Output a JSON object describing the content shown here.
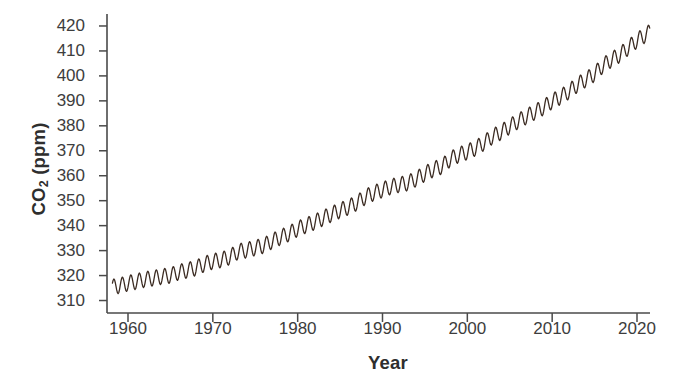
{
  "chart_data": {
    "type": "line",
    "title": "",
    "xlabel": "Year",
    "ylabel": "CO2 (ppm)",
    "ylabel_parts": {
      "pre": "CO",
      "sub": "2",
      "post": " (ppm)"
    },
    "xlim": [
      1957.5,
      1965.0
    ],
    "ylim": [
      305.0,
      424.0
    ],
    "xticks": [
      1960,
      1970,
      1980,
      1990,
      2000,
      2010,
      2020
    ],
    "xtick_labels": [
      "1960",
      "1970",
      "1980",
      "1990",
      "2000",
      "2010",
      "2020"
    ],
    "yticks": [
      310,
      320,
      330,
      340,
      350,
      360,
      370,
      380,
      390,
      400,
      410,
      420
    ],
    "ytick_labels": [
      "310",
      "320",
      "330",
      "340",
      "350",
      "360",
      "370",
      "380",
      "390",
      "400",
      "410",
      "420"
    ],
    "grid": false,
    "legend": null,
    "line_color": "#3b2b22",
    "line_width": 1.3,
    "seasonal_amplitude_ppm": 3.1,
    "series": [
      {
        "name": "Monthly mean CO2 (Mauna Loa)",
        "note": "Annual mean trend; monthly values oscillate about it with a seasonal sawtooth of roughly 3 ppm amplitude peaking in May.",
        "x": [
          1958,
          1959,
          1960,
          1961,
          1962,
          1963,
          1964,
          1965,
          1966,
          1967,
          1968,
          1969,
          1970,
          1971,
          1972,
          1973,
          1974,
          1975,
          1976,
          1977,
          1978,
          1979,
          1980,
          1981,
          1982,
          1983,
          1984,
          1985,
          1986,
          1987,
          1988,
          1989,
          1990,
          1991,
          1992,
          1993,
          1994,
          1995,
          1996,
          1997,
          1998,
          1999,
          2000,
          2001,
          2002,
          2003,
          2004,
          2005,
          2006,
          2007,
          2008,
          2009,
          2010,
          2011,
          2012,
          2013,
          2014,
          2015,
          2016,
          2017,
          2018,
          2019,
          2020,
          2021
        ],
        "values": [
          315.3,
          315.98,
          316.91,
          317.64,
          318.45,
          318.99,
          319.62,
          320.04,
          321.38,
          322.16,
          323.04,
          324.62,
          325.68,
          326.32,
          327.45,
          329.68,
          330.18,
          331.11,
          332.04,
          333.83,
          335.4,
          336.84,
          338.75,
          340.11,
          341.45,
          343.05,
          344.65,
          346.12,
          347.42,
          349.19,
          351.57,
          353.12,
          354.39,
          355.61,
          356.45,
          357.1,
          358.83,
          360.82,
          362.61,
          363.73,
          366.7,
          368.38,
          369.55,
          371.14,
          373.28,
          375.8,
          377.52,
          379.8,
          381.9,
          383.79,
          385.6,
          387.43,
          389.9,
          391.65,
          393.85,
          396.52,
          398.65,
          400.83,
          404.24,
          406.55,
          408.52,
          411.43,
          414.24,
          416.45
        ]
      }
    ]
  },
  "axes": {
    "spines": {
      "left": true,
      "bottom": true,
      "top": false,
      "right": false
    },
    "spine_color": "#4a4a4a"
  }
}
